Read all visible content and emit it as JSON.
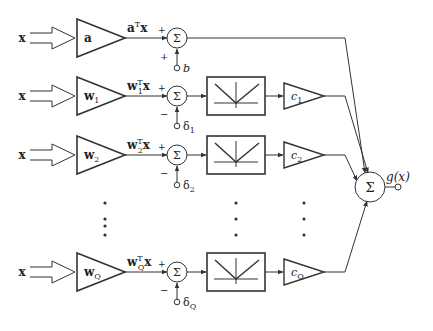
{
  "diagram": {
    "type": "block-diagram",
    "input_label": "x",
    "output_label": "g(x)",
    "sum_symbol": "Σ",
    "rows": [
      {
        "id": "a",
        "weight": "a",
        "weight_sub": "",
        "product_main": "a",
        "product_sub": "",
        "bias": "b",
        "bias_sub": "",
        "bias_sign": "+",
        "in_sign": "+",
        "has_nonlinearity": false,
        "coef": "",
        "coef_sub": ""
      },
      {
        "id": "1",
        "weight": "w",
        "weight_sub": "1",
        "product_main": "w",
        "product_sub": "1",
        "bias": "δ",
        "bias_sub": "1",
        "bias_sign": "−",
        "in_sign": "+",
        "has_nonlinearity": true,
        "coef": "c",
        "coef_sub": "1"
      },
      {
        "id": "2",
        "weight": "w",
        "weight_sub": "2",
        "product_main": "w",
        "product_sub": "2",
        "bias": "δ",
        "bias_sub": "2",
        "bias_sign": "−",
        "in_sign": "+",
        "has_nonlinearity": true,
        "coef": "c",
        "coef_sub": "2"
      },
      {
        "id": "Q",
        "weight": "w",
        "weight_sub": "Q",
        "product_main": "w",
        "product_sub": "Q",
        "bias": "δ",
        "bias_sub": "Q",
        "bias_sign": "−",
        "in_sign": "+",
        "has_nonlinearity": true,
        "coef": "c",
        "coef_sub": "Q"
      }
    ],
    "transpose": "T",
    "product_suffix": "x",
    "ellipsis": "⋮"
  }
}
